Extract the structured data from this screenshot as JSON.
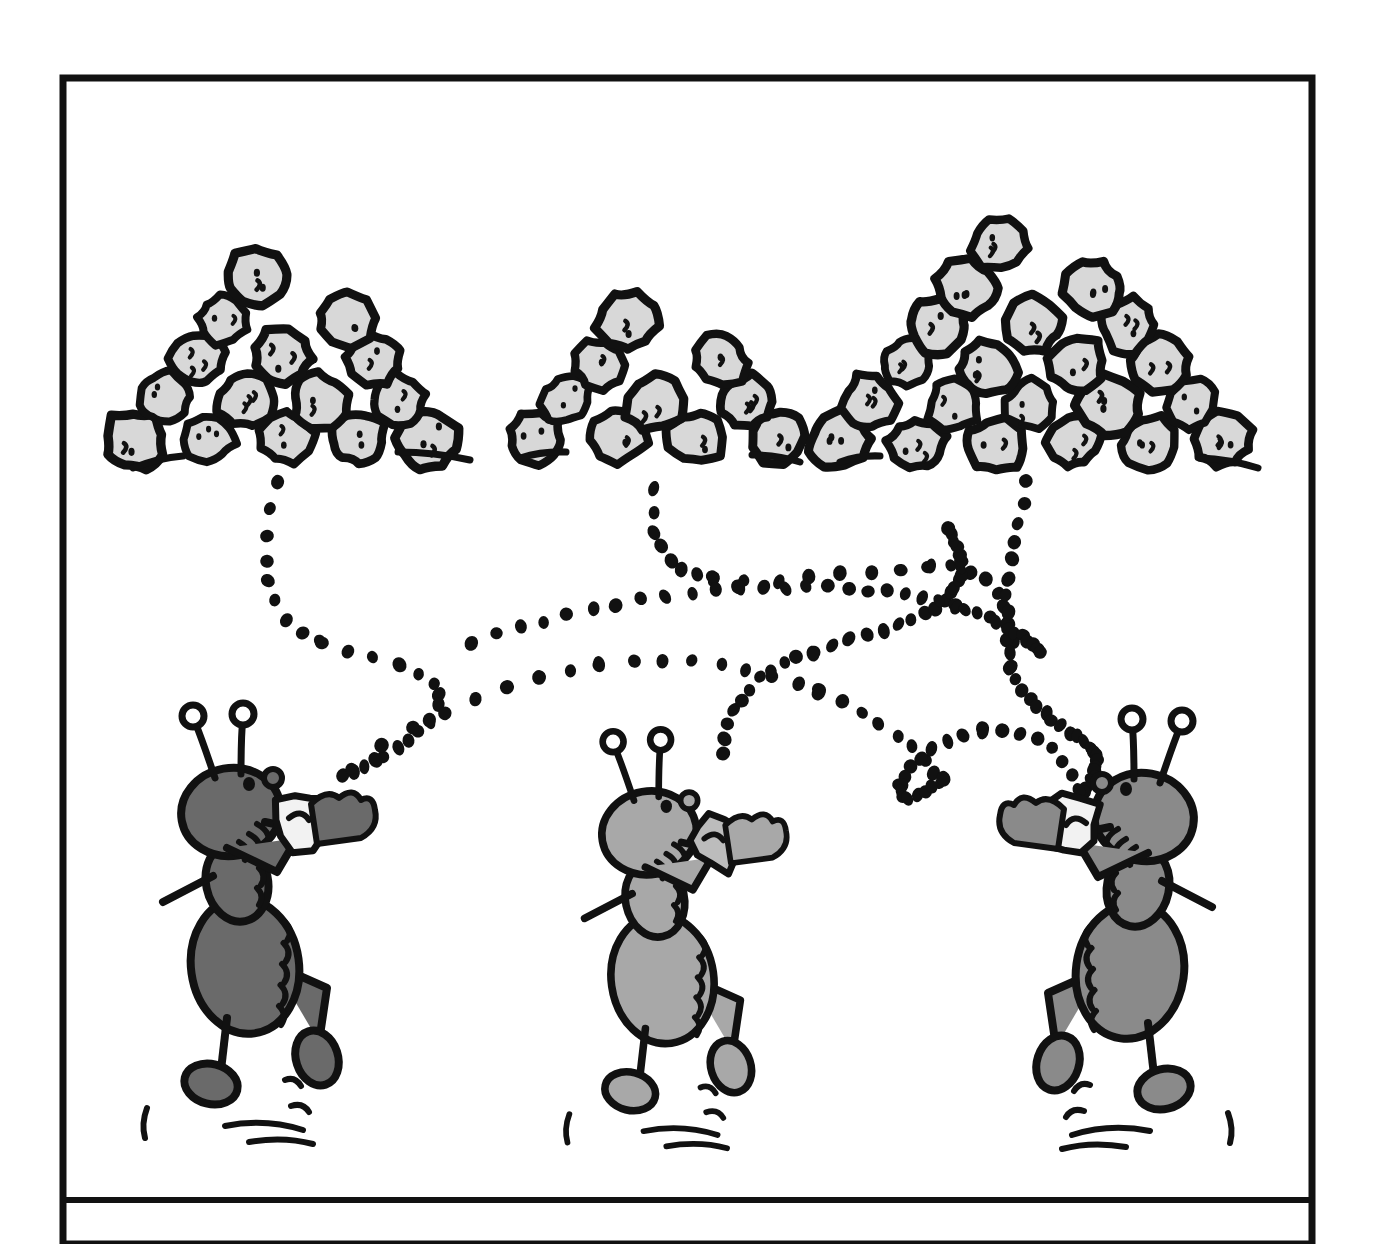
{
  "artwork": {
    "title": "Three ants carrying crumbs to three pebble piles",
    "medium": "black-and-white cartoon line drawing",
    "caption": "",
    "background_color": "#ffffff",
    "ink_color": "#111111"
  },
  "frame": {
    "name": "cartoon-panel-border",
    "x": 63,
    "y": 78,
    "width": 1249,
    "height": 1166,
    "stroke_width": 7,
    "stroke_color": "#111111",
    "caption_divider_y": 1200,
    "caption_divider_stroke": 6
  },
  "piles": [
    {
      "id": "pile-left",
      "label": "left pile",
      "rows": 5,
      "pebble_count": 19,
      "apex_x": 283,
      "base_y": 462,
      "base_half_width": 152,
      "height": 230,
      "fill": "#d8d8d8",
      "outline": "#111111"
    },
    {
      "id": "pile-middle",
      "label": "middle pile",
      "rows": 4,
      "pebble_count": 13,
      "apex_x": 657,
      "base_y": 462,
      "base_half_width": 126,
      "height": 178,
      "fill": "#d8d8d8",
      "outline": "#111111"
    },
    {
      "id": "pile-right",
      "label": "right pile",
      "rows": 6,
      "pebble_count": 28,
      "apex_x": 1032,
      "base_y": 466,
      "base_half_width": 200,
      "height": 272,
      "fill": "#d8d8d8",
      "outline": "#111111"
    }
  ],
  "ants": [
    {
      "id": "ant-left",
      "label": "left ant",
      "facing": "right",
      "body_fill": "#6a6a6a",
      "outline": "#111111",
      "carrying": "white crumb",
      "crumb_fill": "#f2f2f2",
      "x": 255,
      "y": 930,
      "scale": 1.0
    },
    {
      "id": "ant-middle",
      "label": "middle ant",
      "facing": "right",
      "body_fill": "#a8a8a8",
      "outline": "#111111",
      "carrying": "gray crumb",
      "crumb_fill": "#bcbcbc",
      "x": 672,
      "y": 945,
      "scale": 0.95
    },
    {
      "id": "ant-right",
      "label": "right ant",
      "facing": "left",
      "body_fill": "#8a8a8a",
      "outline": "#111111",
      "carrying": "white crumb",
      "crumb_fill": "#f2f2f2",
      "x": 1120,
      "y": 935,
      "scale": 1.0
    }
  ],
  "trails": [
    {
      "id": "trail-left-ant",
      "label": "dotted trail from left ant to left pile",
      "dot_count": 24,
      "dot_radius": 6,
      "color": "#111111"
    },
    {
      "id": "trail-middle-ant",
      "label": "dotted trail from middle ant crossing to right",
      "dot_count": 30,
      "dot_radius": 6,
      "color": "#111111"
    },
    {
      "id": "trail-right-ant",
      "label": "dotted trail from right ant crossing to left pile area",
      "dot_count": 34,
      "dot_radius": 6,
      "color": "#111111"
    },
    {
      "id": "trail-middle-pile",
      "label": "dotted trail descending from middle pile",
      "dot_count": 20,
      "dot_radius": 6,
      "color": "#111111"
    }
  ],
  "ground_lines": [
    {
      "id": "ground-left",
      "x1": 133,
      "y1": 468,
      "x2": 183,
      "y2": 456
    },
    {
      "id": "ground-left-right",
      "x1": 398,
      "y1": 452,
      "x2": 470,
      "y2": 460
    },
    {
      "id": "ground-middle-left",
      "x1": 520,
      "y1": 458,
      "x2": 566,
      "y2": 452
    },
    {
      "id": "ground-middle-right",
      "x1": 752,
      "y1": 455,
      "x2": 800,
      "y2": 462
    },
    {
      "id": "ground-right-left",
      "x1": 840,
      "y1": 462,
      "x2": 880,
      "y2": 456
    },
    {
      "id": "ground-right-right",
      "x1": 1200,
      "y1": 458,
      "x2": 1258,
      "y2": 468
    }
  ]
}
